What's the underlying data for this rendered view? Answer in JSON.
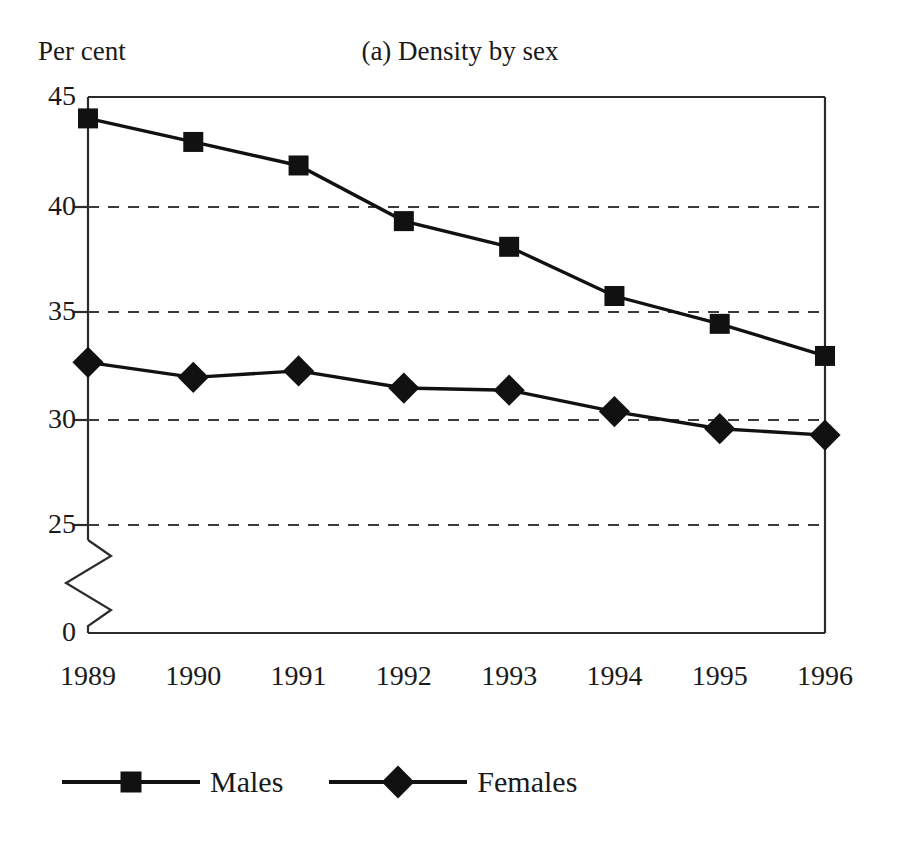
{
  "figure": {
    "title": "(a) Density by sex",
    "y_unit_label": "Per cent",
    "background_color": "#ffffff",
    "ink_color": "#111111"
  },
  "legend": {
    "position": "bottom",
    "entries": [
      {
        "label": "Males",
        "marker": "square-marker",
        "color": "#111111"
      },
      {
        "label": "Females",
        "marker": "diamond-marker",
        "color": "#111111"
      }
    ]
  },
  "axes": {
    "y_ticks": [
      "45",
      "40",
      "35",
      "30",
      "25",
      "0"
    ],
    "x_ticks": [
      "1989",
      "1990",
      "1991",
      "1992",
      "1993",
      "1994",
      "1995",
      "1996"
    ],
    "y_axis_break": true,
    "gridlines": "dashed-horizontal"
  },
  "chart_data": {
    "type": "line",
    "title": "(a) Density by sex",
    "xlabel": "",
    "ylabel": "Per cent",
    "categories": [
      "1989",
      "1990",
      "1991",
      "1992",
      "1993",
      "1994",
      "1995",
      "1996"
    ],
    "series": [
      {
        "name": "Males",
        "marker": "square",
        "values": [
          44.0,
          42.9,
          41.8,
          39.2,
          38.0,
          35.7,
          34.4,
          32.9
        ]
      },
      {
        "name": "Females",
        "marker": "diamond",
        "values": [
          32.6,
          31.9,
          32.2,
          31.4,
          31.3,
          30.3,
          29.5,
          29.2
        ]
      }
    ],
    "ylim": [
      25,
      45
    ],
    "y_ticks": [
      25,
      30,
      35,
      40,
      45
    ],
    "y_axis_break_below": 25,
    "y_baseline_label": 0,
    "grid": true,
    "legend_position": "bottom"
  }
}
